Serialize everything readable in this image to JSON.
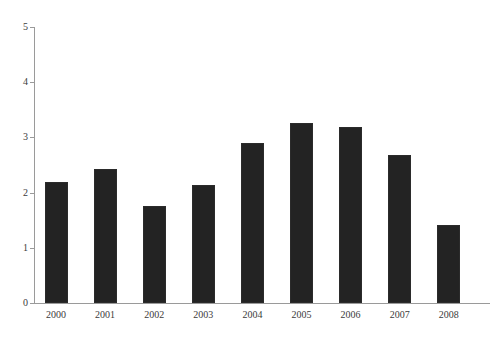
{
  "chart_data": {
    "type": "bar",
    "title": "",
    "subtitle": "",
    "xlabel": "",
    "ylabel": "",
    "categories": [
      "2000",
      "2001",
      "2002",
      "2003",
      "2004",
      "2005",
      "2006",
      "2007",
      "2008"
    ],
    "values": [
      2.2,
      2.42,
      1.76,
      2.13,
      2.89,
      3.26,
      3.19,
      2.68,
      1.41
    ],
    "series": [
      {
        "name": "",
        "values": [
          2.2,
          2.42,
          1.76,
          2.13,
          2.89,
          3.26,
          3.19,
          2.68,
          1.41
        ]
      }
    ],
    "ylim": [
      0,
      5
    ],
    "yticks": [
      0,
      1,
      2,
      3,
      4,
      5
    ],
    "ytick_labels": [
      "0",
      "1",
      "2",
      "3",
      "4",
      "5"
    ],
    "xtick_labels": [
      "2000",
      "2001",
      "2002",
      "2003",
      "2004",
      "2005",
      "2006",
      "2007",
      "2008"
    ],
    "grid": false,
    "legend": false,
    "legend_position": "none",
    "bar_color": "#232323",
    "axis_color": "#9a9a9a",
    "text_color": "#3b3b3b",
    "background_color": "#ffffff"
  }
}
